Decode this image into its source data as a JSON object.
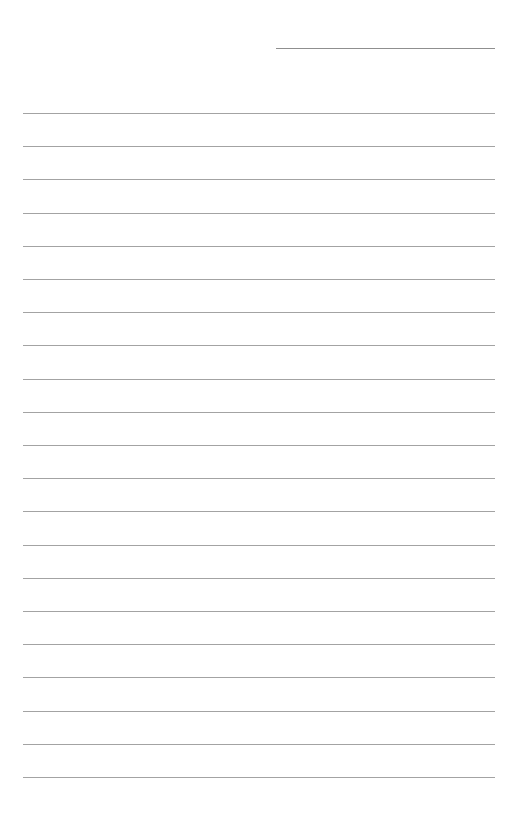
{
  "page": {
    "type": "blank lined sheet",
    "header_line": {
      "label": ""
    },
    "lines": [
      {
        "text": ""
      },
      {
        "text": ""
      },
      {
        "text": ""
      },
      {
        "text": ""
      },
      {
        "text": ""
      },
      {
        "text": ""
      },
      {
        "text": ""
      },
      {
        "text": ""
      },
      {
        "text": ""
      },
      {
        "text": ""
      },
      {
        "text": ""
      },
      {
        "text": ""
      },
      {
        "text": ""
      },
      {
        "text": ""
      },
      {
        "text": ""
      },
      {
        "text": ""
      },
      {
        "text": ""
      },
      {
        "text": ""
      },
      {
        "text": ""
      },
      {
        "text": ""
      },
      {
        "text": ""
      }
    ]
  }
}
